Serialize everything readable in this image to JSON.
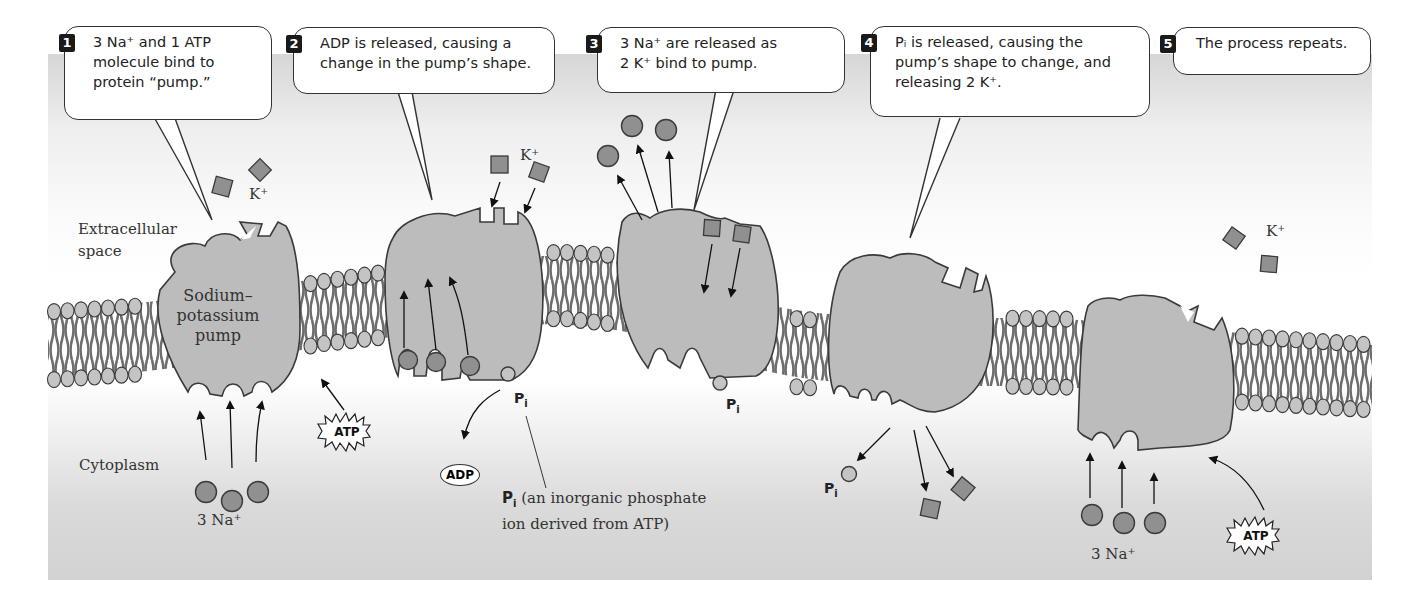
{
  "figure": {
    "regions": {
      "extracellular": "Extracellular space",
      "extracellular_line1": "Extracellular",
      "extracellular_line2": "space",
      "cytoplasm": "Cytoplasm"
    },
    "pump_label": {
      "line1": "Sodium–",
      "line2": "potassium",
      "line3": "pump"
    },
    "steps": [
      {
        "number": "1",
        "lines": [
          "3 Na⁺ and 1 ATP",
          "molecule bind to",
          "protein “pump.”"
        ]
      },
      {
        "number": "2",
        "lines": [
          "ADP is released, causing a",
          "change in  the pump’s shape."
        ]
      },
      {
        "number": "3",
        "lines": [
          "3 Na⁺ are released as",
          "2 K⁺ bind to pump."
        ]
      },
      {
        "number": "4",
        "lines": [
          "Pᵢ is released, causing the",
          "pump’s shape to change, and",
          "releasing 2 K⁺."
        ]
      },
      {
        "number": "5",
        "lines": [
          "The process repeats."
        ]
      }
    ],
    "ion_labels": {
      "k_plus": "K⁺",
      "three_na_plus": "3 Na⁺"
    },
    "molecules": {
      "atp": "ATP",
      "adp": "ADP",
      "pi_main": "P",
      "pi_sub": "i"
    },
    "pi_note": {
      "symbol": "P",
      "sub": "i",
      "line1": " (an inorganic phosphate",
      "line2": "ion derived from ATP)"
    },
    "colors": {
      "protein_fill": "#bcbcbc",
      "ion_fill": "#909090",
      "lipid_head": "#c4c4c4",
      "lipid_tail": "#6e6e6e",
      "outline": "#3a3a3a"
    }
  }
}
